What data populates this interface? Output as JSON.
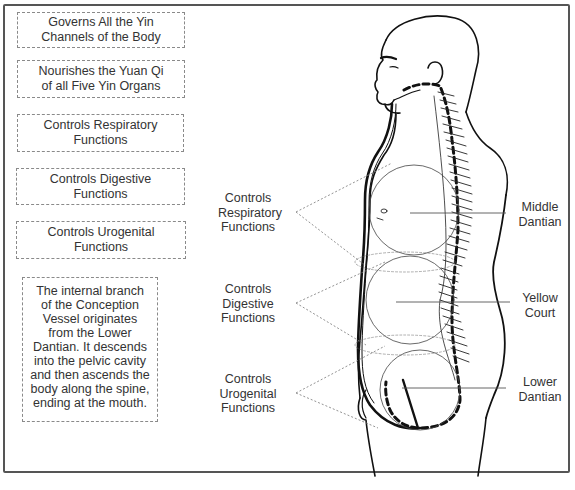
{
  "left_boxes": [
    {
      "line1": "Governs All the Yin",
      "line2": "Channels of the Body"
    },
    {
      "line1": "Nourishes the Yuan Qi",
      "line2": "of all Five Yin Organs"
    },
    {
      "line1": "Controls Respiratory",
      "line2": "Functions"
    },
    {
      "line1": "Controls Digestive",
      "line2": "Functions"
    },
    {
      "line1": "Controls Urogenital",
      "line2": "Functions"
    }
  ],
  "description": {
    "lines": [
      "The internal branch",
      "of the Conception",
      "Vessel originates",
      "from the Lower",
      "Dantian. It descends",
      "into the pelvic cavity",
      "and then ascends the",
      "body along the spine,",
      "ending at the mouth."
    ]
  },
  "middle_labels": [
    {
      "line1": "Controls",
      "line2": "Respiratory",
      "line3": "Functions"
    },
    {
      "line1": "Controls",
      "line2": "Digestive",
      "line3": "Functions"
    },
    {
      "line1": "Controls",
      "line2": "Urogenital",
      "line3": "Functions"
    }
  ],
  "right_labels": [
    {
      "line1": "Middle",
      "line2": "Dantian"
    },
    {
      "line1": "Yellow",
      "line2": "Court"
    },
    {
      "line1": "Lower",
      "line2": "Dantian"
    }
  ],
  "colors": {
    "frame": "#555555",
    "text": "#333333",
    "dashed": "#8a8a8a",
    "figure_line": "#111111"
  }
}
